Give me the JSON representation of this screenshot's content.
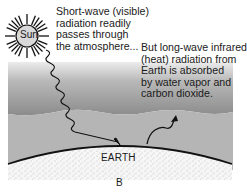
{
  "diagram": {
    "panel_label": "B",
    "sun": {
      "label": "Sun",
      "icon": "sun-icon"
    },
    "earth": {
      "label": "EARTH"
    },
    "shortwave": {
      "text": "Short-wave (visible)\nradiation readily\npasses through\nthe atmosphere...",
      "arrow_icon": "wavy-arrow-down-icon"
    },
    "longwave": {
      "text": "But long-wave infrared\n(heat) radiation from\nEarth is absorbed\nby water vapor and\ncarbon dioxide.",
      "arrow_icon": "wavy-arrow-up-icon"
    },
    "colors": {
      "atmosphere_top": "#e8e8e8",
      "atmosphere_dark": "#8f8f8f",
      "atmosphere_lower": "#b7b7b7",
      "earth_fill": "#f4f4f4",
      "earth_dots": "#9a9a9a",
      "line": "#111111"
    }
  }
}
